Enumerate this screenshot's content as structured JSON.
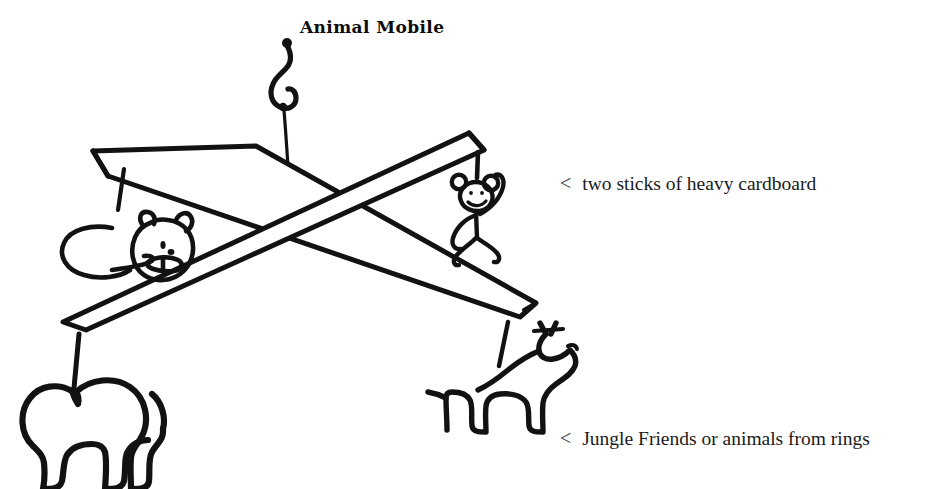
{
  "page": {
    "title": "Animal Mobile",
    "background_color": "#ffffff",
    "ink_color": "#121212",
    "width": 928,
    "height": 489
  },
  "annotations": [
    {
      "id": "sticks",
      "marker": "<",
      "text": "two sticks of heavy cardboard"
    },
    {
      "id": "animals",
      "marker": "<",
      "text": "Jungle Friends or animals from rings"
    }
  ],
  "figure": {
    "type": "hand-drawn-craft-diagram",
    "parts": [
      {
        "name": "hanging-hook",
        "label": "hook"
      },
      {
        "name": "hanging-string",
        "label": "string"
      },
      {
        "name": "cardboard-stick-left",
        "label": "cardboard stick"
      },
      {
        "name": "cardboard-stick-right",
        "label": "cardboard stick"
      },
      {
        "name": "lion-figure",
        "label": "lion"
      },
      {
        "name": "monkey-figure",
        "label": "monkey"
      },
      {
        "name": "elephant-figure",
        "label": "elephant"
      },
      {
        "name": "giraffe-figure",
        "label": "giraffe"
      }
    ]
  }
}
